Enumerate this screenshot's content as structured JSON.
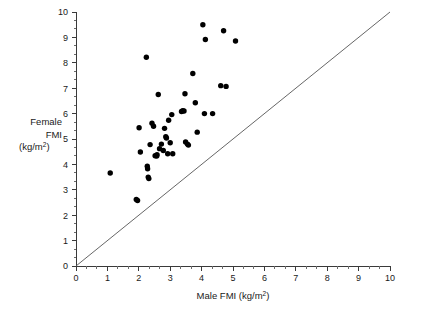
{
  "chart_data": {
    "type": "scatter",
    "title": "",
    "subtitle": "",
    "xlabel": "Male FMI (kg/m2)",
    "xlabel_base": "Male FMI (kg/m",
    "xlabel_sup": "2",
    "xlabel_tail": ")",
    "ylabel": "Female FMI (kg/m2)",
    "ylabel_lines": [
      "Female",
      "FMI",
      "(kg/m"
    ],
    "ylabel_sup": "2",
    "ylabel_tail": ")",
    "xlim": [
      0,
      10
    ],
    "ylim": [
      0,
      10
    ],
    "xticks": [
      0,
      1,
      2,
      3,
      4,
      5,
      6,
      7,
      8,
      9,
      10
    ],
    "yticks": [
      0,
      1,
      2,
      3,
      4,
      5,
      6,
      7,
      8,
      9,
      10
    ],
    "xticklabels": [
      "0",
      "1",
      "2",
      "3",
      "4",
      "5",
      "6",
      "7",
      "8",
      "9",
      "10"
    ],
    "yticklabels": [
      "0",
      "1",
      "2",
      "3",
      "4",
      "5",
      "6",
      "7",
      "8",
      "9",
      "10"
    ],
    "minor_ticks_per_interval": 2,
    "grid": false,
    "legend": null,
    "legend_position": "none",
    "marker": "filled-circle",
    "marker_color": "#000000",
    "marker_size_px": 5.4,
    "reference_line": {
      "name": "line-of-identity",
      "type": "line",
      "from": [
        0,
        0
      ],
      "to": [
        10,
        10
      ],
      "color": "#555555",
      "width": 0.9
    },
    "points": [
      [
        1.09,
        3.66
      ],
      [
        1.92,
        2.62
      ],
      [
        1.96,
        2.58
      ],
      [
        2.01,
        5.44
      ],
      [
        2.05,
        4.49
      ],
      [
        2.24,
        8.22
      ],
      [
        2.27,
        3.93
      ],
      [
        2.28,
        3.83
      ],
      [
        2.3,
        3.5
      ],
      [
        2.32,
        3.44
      ],
      [
        2.36,
        4.78
      ],
      [
        2.42,
        5.62
      ],
      [
        2.47,
        5.5
      ],
      [
        2.52,
        4.34
      ],
      [
        2.57,
        4.33
      ],
      [
        2.58,
        4.38
      ],
      [
        2.62,
        6.75
      ],
      [
        2.66,
        4.62
      ],
      [
        2.72,
        4.8
      ],
      [
        2.78,
        4.55
      ],
      [
        2.82,
        5.42
      ],
      [
        2.86,
        5.09
      ],
      [
        2.88,
        5.04
      ],
      [
        2.92,
        4.42
      ],
      [
        2.95,
        5.74
      ],
      [
        3.0,
        4.85
      ],
      [
        3.05,
        5.96
      ],
      [
        3.08,
        4.42
      ],
      [
        3.36,
        6.08
      ],
      [
        3.4,
        6.11
      ],
      [
        3.44,
        6.1
      ],
      [
        3.47,
        6.78
      ],
      [
        3.49,
        4.88
      ],
      [
        3.55,
        4.8
      ],
      [
        3.58,
        4.76
      ],
      [
        3.72,
        7.58
      ],
      [
        3.8,
        6.43
      ],
      [
        3.86,
        5.27
      ],
      [
        4.04,
        9.5
      ],
      [
        4.09,
        6.0
      ],
      [
        4.12,
        8.92
      ],
      [
        4.35,
        6.0
      ],
      [
        4.61,
        7.1
      ],
      [
        4.7,
        9.26
      ],
      [
        4.78,
        7.07
      ],
      [
        5.08,
        8.86
      ]
    ]
  },
  "axes": {
    "x_axis_name": "x-axis",
    "y_axis_name": "y-axis"
  }
}
